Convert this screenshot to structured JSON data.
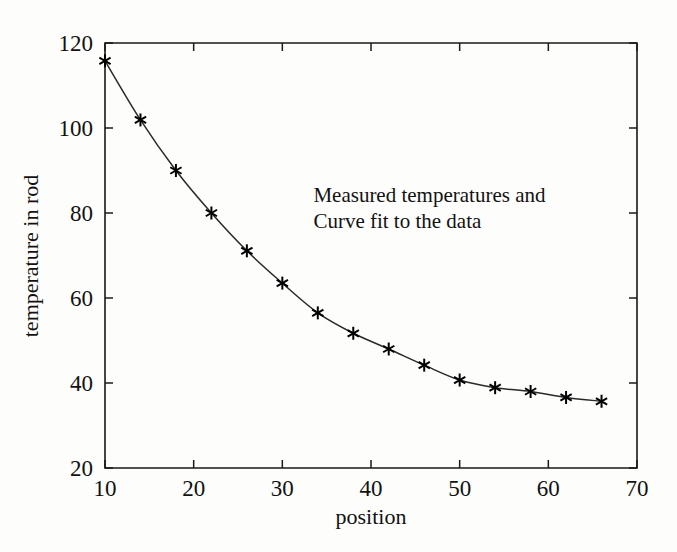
{
  "figure": {
    "background_color": "#fdfdfb",
    "foreground_color": "#121212",
    "annotation_line1": "Measured temperatures and",
    "annotation_line2": "Curve fit to the data"
  },
  "chart_data": {
    "type": "scatter",
    "title": "",
    "subtitle": "",
    "xlabel": "position",
    "ylabel": "temperature in rod",
    "xlim": [
      10,
      70
    ],
    "ylim": [
      20,
      120
    ],
    "xticks": [
      10,
      20,
      30,
      40,
      50,
      60,
      70
    ],
    "xticklabels": [
      "10",
      "20",
      "30",
      "40",
      "50",
      "60",
      "70"
    ],
    "yticks": [
      20,
      40,
      60,
      80,
      100,
      120
    ],
    "yticklabels": [
      "20",
      "40",
      "60",
      "80",
      "100",
      "120"
    ],
    "grid": false,
    "legend": false,
    "legend_position": "none",
    "annotations": [
      {
        "text": "Measured temperatures and",
        "x": 33.5,
        "y": 82.5
      },
      {
        "text": "Curve fit to the data",
        "x": 33.5,
        "y": 76.5
      }
    ],
    "series": [
      {
        "name": "Measured temperatures",
        "marker": "asterisk",
        "marker_color": "#000000",
        "line": false,
        "x": [
          10,
          14,
          18,
          22,
          26,
          30,
          34,
          38,
          42,
          46,
          50,
          54,
          58,
          62,
          66
        ],
        "values": [
          115.8,
          101.9,
          90.0,
          80.0,
          71.1,
          63.5,
          56.5,
          51.7,
          48.0,
          44.2,
          40.7,
          38.9,
          38.0,
          36.6,
          35.7
        ]
      },
      {
        "name": "Curve fit to the data",
        "marker": "none",
        "line": true,
        "line_color": "#2a2a2a",
        "x": [
          10,
          14,
          18,
          22,
          26,
          30,
          34,
          38,
          42,
          46,
          50,
          54,
          58,
          62,
          66
        ],
        "values": [
          115.8,
          101.9,
          90.0,
          80.0,
          71.1,
          63.5,
          56.5,
          51.7,
          48.0,
          44.2,
          40.7,
          38.9,
          38.0,
          36.6,
          35.7
        ]
      }
    ]
  }
}
